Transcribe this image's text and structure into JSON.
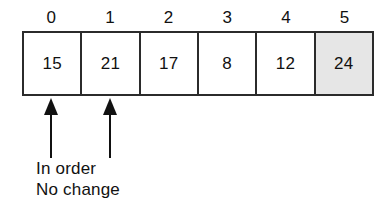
{
  "figure": {
    "colors": {
      "background": "#ffffff",
      "ink": "#111111",
      "border": "#2b2b2b",
      "shaded_cell": "#e6e6e6"
    }
  },
  "array": {
    "indices": [
      "0",
      "1",
      "2",
      "3",
      "4",
      "5"
    ],
    "cells": [
      {
        "index": "0",
        "value": "15",
        "shaded": false
      },
      {
        "index": "1",
        "value": "21",
        "shaded": false
      },
      {
        "index": "2",
        "value": "17",
        "shaded": false
      },
      {
        "index": "3",
        "value": "8",
        "shaded": false
      },
      {
        "index": "4",
        "value": "12",
        "shaded": false
      },
      {
        "index": "5",
        "value": "24",
        "shaded": true
      }
    ]
  },
  "pointers": [
    {
      "name": "pointer-index-0",
      "target_index": "0",
      "direction": "up"
    },
    {
      "name": "pointer-index-1",
      "target_index": "1",
      "direction": "up"
    }
  ],
  "caption": {
    "line1": "In order",
    "line2": "No change"
  }
}
